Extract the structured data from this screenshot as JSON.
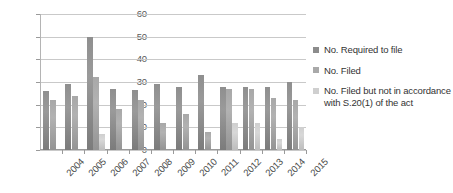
{
  "chart_data": {
    "type": "bar",
    "title": "",
    "xlabel": "",
    "ylabel": "",
    "ylim": [
      0,
      60
    ],
    "ytick_step": 10,
    "grid": true,
    "legend_position": "right",
    "categories": [
      "2004",
      "2005",
      "2006",
      "2007",
      "2008",
      "2009",
      "2010",
      "2011",
      "2012",
      "2013",
      "2014",
      "2015"
    ],
    "ytick_labels": [
      "60",
      "50",
      "40",
      "30",
      "20",
      "10",
      "0"
    ],
    "series": [
      {
        "name": "No. Required to file",
        "color": "#8c8c8c",
        "values": [
          26,
          29,
          50,
          27,
          26.5,
          29,
          28,
          33,
          28,
          28,
          28,
          30
        ]
      },
      {
        "name": "No. Filed",
        "color": "#a9a9a9",
        "values": [
          22,
          24,
          32,
          18,
          22,
          12,
          16,
          8,
          27,
          27,
          23,
          22
        ]
      },
      {
        "name": "No. Filed but not in accordance with S.20(1) of the act",
        "color": "#cfcfcf",
        "values": [
          0,
          0,
          7,
          0,
          0,
          0,
          0,
          0,
          12,
          12,
          5,
          10
        ]
      }
    ]
  },
  "legend": {
    "items": [
      {
        "label": "No. Required to file",
        "swatch": "s0"
      },
      {
        "label": "No. Filed",
        "swatch": "s1"
      },
      {
        "label": "No. Filed but not in accordance with S.20(1) of the act",
        "swatch": "s2"
      }
    ]
  }
}
